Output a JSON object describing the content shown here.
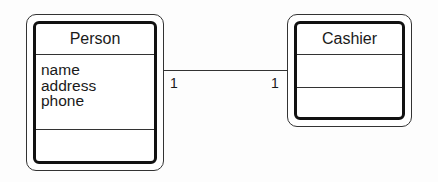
{
  "diagram": {
    "type": "UML class diagram",
    "classes": [
      {
        "name": "Person",
        "attributes": [
          "name",
          "address",
          "phone"
        ],
        "operations": []
      },
      {
        "name": "Cashier",
        "attributes": [],
        "operations": []
      }
    ],
    "associations": [
      {
        "from": "Person",
        "to": "Cashier",
        "from_multiplicity": "1",
        "to_multiplicity": "1"
      }
    ]
  }
}
